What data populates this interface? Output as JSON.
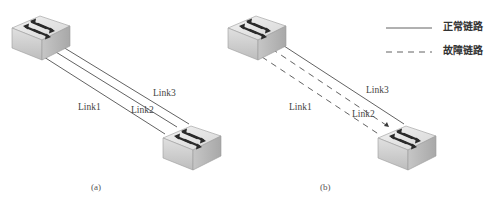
{
  "diagram_a": {
    "caption": "(a)",
    "links": [
      {
        "label": "Link1",
        "style": "solid"
      },
      {
        "label": "Link2",
        "style": "solid"
      },
      {
        "label": "Link3",
        "style": "solid"
      }
    ]
  },
  "diagram_b": {
    "caption": "(b)",
    "links": [
      {
        "label": "Link1",
        "style": "dashed"
      },
      {
        "label": "Link2",
        "style": "dashed"
      },
      {
        "label": "Link3",
        "style": "solid"
      }
    ]
  },
  "legend": {
    "items": [
      {
        "label": "正常链路",
        "style": "solid"
      },
      {
        "label": "故障链路",
        "style": "dashed"
      }
    ]
  },
  "colors": {
    "line": "#3a3a3a",
    "switch_top": "#e4e4e4",
    "switch_front": "#cfcfcf",
    "switch_side": "#b5b5b5",
    "arrow": "#2a2a2a"
  }
}
